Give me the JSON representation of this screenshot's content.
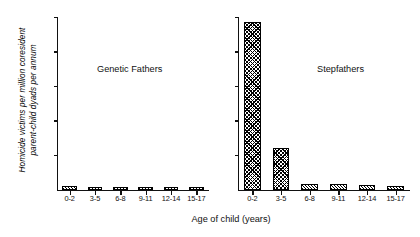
{
  "chart_data": {
    "type": "bar",
    "title": "",
    "xlabel": "Age of child (years)",
    "ylabel": "Homicide victims per million coresident parent-child dyads per annum",
    "ylabel_line1": "Homicide victims per million coresident",
    "ylabel_line2": "parent-child dyads per annum",
    "categories": [
      "0-2",
      "3-5",
      "6-8",
      "9-11",
      "12-14",
      "15-17"
    ],
    "ylim": [
      0,
      100
    ],
    "y_tick_count": 5,
    "y_tick_labels": [],
    "grid": false,
    "legend": "none",
    "bar_style": {
      "fill": "#ffffff",
      "hatch": "crosshatch-diagonal",
      "edge_color": "#000000"
    },
    "panels": [
      {
        "name": "genetic-fathers",
        "label": "Genetic Fathers",
        "values": [
          2.0,
          1.6,
          0.9,
          0.5,
          0.5,
          0.5
        ]
      },
      {
        "name": "stepfathers",
        "label": "Stepfathers",
        "values": [
          97.0,
          24.0,
          3.0,
          3.0,
          2.5,
          2.0
        ]
      }
    ]
  }
}
